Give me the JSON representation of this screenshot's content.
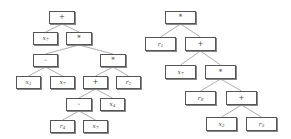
{
  "trees": [
    {
      "id": "left-tree",
      "nodes": [
        {
          "id": "L0",
          "label": "+",
          "type": "op"
        },
        {
          "id": "L1",
          "label": "x7",
          "type": "leaf",
          "parent": "L0"
        },
        {
          "id": "L2",
          "label": "*",
          "type": "op",
          "parent": "L0"
        },
        {
          "id": "L3",
          "label": "-",
          "type": "op",
          "parent": "L2"
        },
        {
          "id": "L4",
          "label": "*",
          "type": "op",
          "parent": "L2"
        },
        {
          "id": "L5",
          "label": "x1",
          "type": "leaf",
          "parent": "L3"
        },
        {
          "id": "L6",
          "label": "x7",
          "type": "leaf",
          "parent": "L3"
        },
        {
          "id": "L7",
          "label": "+",
          "type": "op",
          "parent": "L4"
        },
        {
          "id": "L8",
          "label": "r2",
          "type": "leaf",
          "parent": "L4"
        },
        {
          "id": "L9",
          "label": "-",
          "type": "op",
          "parent": "L7"
        },
        {
          "id": "L10",
          "label": "x4",
          "type": "leaf",
          "parent": "L7"
        },
        {
          "id": "L11",
          "label": "r4",
          "type": "leaf",
          "parent": "L9"
        },
        {
          "id": "L12",
          "label": "x7",
          "type": "leaf",
          "parent": "L9"
        }
      ]
    },
    {
      "id": "right-tree",
      "nodes": [
        {
          "id": "R0",
          "label": "*",
          "type": "op"
        },
        {
          "id": "R1",
          "label": "r1",
          "type": "leaf",
          "parent": "R0"
        },
        {
          "id": "R2",
          "label": "+",
          "type": "op",
          "parent": "R0"
        },
        {
          "id": "R3",
          "label": "x7",
          "type": "leaf",
          "parent": "R2"
        },
        {
          "id": "R4",
          "label": "*",
          "type": "op",
          "parent": "R2"
        },
        {
          "id": "R5",
          "label": "r8",
          "type": "leaf",
          "parent": "R4"
        },
        {
          "id": "R6",
          "label": "+",
          "type": "op",
          "parent": "R4"
        },
        {
          "id": "R7",
          "label": "x2",
          "type": "leaf",
          "parent": "R6"
        },
        {
          "id": "R8",
          "label": "r3",
          "type": "leaf",
          "parent": "R6"
        }
      ]
    }
  ]
}
